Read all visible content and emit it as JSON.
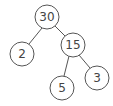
{
  "diagram": {
    "type": "factor-tree",
    "nodes": [
      {
        "id": "n30",
        "label": "30",
        "x": 47,
        "y": 17
      },
      {
        "id": "n2",
        "label": "2",
        "x": 22,
        "y": 54
      },
      {
        "id": "n15",
        "label": "15",
        "x": 73,
        "y": 45
      },
      {
        "id": "n5",
        "label": "5",
        "x": 62,
        "y": 88
      },
      {
        "id": "n3",
        "label": "3",
        "x": 97,
        "y": 78
      }
    ],
    "edges": [
      {
        "from": "n30",
        "to": "n2"
      },
      {
        "from": "n30",
        "to": "n15"
      },
      {
        "from": "n15",
        "to": "n5"
      },
      {
        "from": "n15",
        "to": "n3"
      }
    ]
  }
}
